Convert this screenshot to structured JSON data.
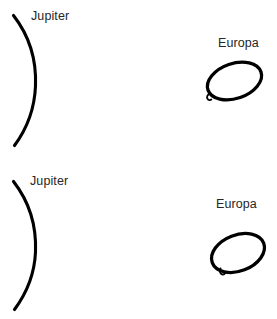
{
  "figure": {
    "title": "",
    "background_color": "#ffffff",
    "stroke_color": "#000000",
    "text_color": "#262626",
    "width": 277,
    "height": 319,
    "panel_count": 2
  },
  "panels": [
    {
      "id": "top",
      "jupiter": {
        "label": "Jupiter",
        "shape": "limb-arc",
        "description": "curved planetary limb arc bulging to the right"
      },
      "europa": {
        "label": "Europa",
        "shape": "tilted-ellipse",
        "tick": "lower-left",
        "description": "tilted ellipse outline with small tick mark at lower left"
      }
    },
    {
      "id": "bottom",
      "jupiter": {
        "label": "Jupiter",
        "shape": "limb-arc",
        "description": "curved planetary limb arc bulging to the right"
      },
      "europa": {
        "label": "Europa",
        "shape": "tilted-ellipse",
        "tick": "bottom",
        "description": "tilted ellipse outline with small tick mark at bottom"
      }
    }
  ]
}
